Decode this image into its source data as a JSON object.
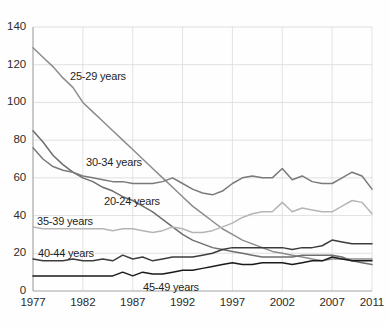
{
  "chart_data": {
    "type": "line",
    "title": "",
    "subtitle": "",
    "xlabel": "",
    "ylabel": "",
    "xlim": [
      1977,
      2011
    ],
    "ylim": [
      0,
      140
    ],
    "grid": true,
    "legend_position": "inline-labels",
    "y_ticks": [
      0,
      20,
      40,
      60,
      80,
      100,
      120,
      140
    ],
    "x_ticks": [
      1977,
      1982,
      1987,
      1992,
      1997,
      2002,
      2007,
      2011
    ],
    "y_tick_labels": [
      "0",
      "20",
      "40",
      "60",
      "80",
      "100",
      "120",
      "140"
    ],
    "x_tick_labels": [
      "1977",
      "1982",
      "1987",
      "1992",
      "1997",
      "2002",
      "2007",
      "2011"
    ],
    "x": [
      1977,
      1978,
      1979,
      1980,
      1981,
      1982,
      1983,
      1984,
      1985,
      1986,
      1987,
      1988,
      1989,
      1990,
      1991,
      1992,
      1993,
      1994,
      1995,
      1996,
      1997,
      1998,
      1999,
      2000,
      2001,
      2002,
      2003,
      2004,
      2005,
      2006,
      2007,
      2008,
      2009,
      2010,
      2011
    ],
    "series": [
      {
        "name": "25-29 years",
        "color": "#8c8c8c",
        "label": "25-29 years",
        "values": [
          129,
          124,
          119,
          113,
          108,
          100,
          95,
          90,
          85,
          80,
          75,
          70,
          65,
          60,
          55,
          50,
          45,
          41,
          37,
          33,
          30,
          27,
          25,
          23,
          21,
          20,
          19,
          18,
          17,
          16,
          17,
          17,
          17,
          17,
          17
        ]
      },
      {
        "name": "20-24 years",
        "color": "#6e6e6e",
        "label": "20-24 years",
        "values": [
          85,
          79,
          72,
          67,
          63,
          60,
          58,
          55,
          53,
          50,
          48,
          45,
          42,
          38,
          34,
          30,
          27,
          25,
          23,
          22,
          21,
          20,
          19,
          18,
          18,
          18,
          18,
          19,
          19,
          19,
          19,
          18,
          16,
          15,
          14
        ]
      },
      {
        "name": "30-34 years",
        "color": "#7a7a7a",
        "label": "30-34 years",
        "values": [
          76,
          70,
          66,
          64,
          63,
          61,
          60,
          59,
          58,
          58,
          57,
          57,
          57,
          58,
          60,
          57,
          54,
          52,
          51,
          53,
          57,
          60,
          61,
          60,
          60,
          65,
          59,
          61,
          58,
          57,
          57,
          60,
          63,
          61,
          54
        ]
      },
      {
        "name": "35-39 years",
        "color": "#b5b5b5",
        "label": "35-39 years",
        "values": [
          34,
          33,
          33,
          33,
          33,
          33,
          33,
          33,
          32,
          33,
          33,
          32,
          31,
          32,
          34,
          33,
          31,
          31,
          32,
          34,
          36,
          39,
          41,
          42,
          42,
          47,
          42,
          44,
          43,
          42,
          42,
          45,
          48,
          47,
          41
        ]
      },
      {
        "name": "40-44 years",
        "color": "#3c3c3c",
        "label": "40-44 years",
        "values": [
          17,
          16,
          16,
          16,
          17,
          16,
          16,
          17,
          16,
          19,
          17,
          18,
          16,
          17,
          18,
          18,
          18,
          19,
          20,
          22,
          23,
          23,
          23,
          23,
          23,
          23,
          22,
          23,
          23,
          24,
          27,
          26,
          25,
          25,
          25
        ]
      },
      {
        "name": "45-49 years",
        "color": "#1a1a1a",
        "label": "45-49 years",
        "values": [
          8,
          8,
          8,
          8,
          8,
          8,
          8,
          8,
          8,
          10,
          8,
          10,
          9,
          9,
          10,
          11,
          11,
          12,
          13,
          14,
          15,
          14,
          14,
          15,
          15,
          15,
          14,
          15,
          16,
          16,
          18,
          17,
          16,
          16,
          16
        ]
      }
    ],
    "series_label_positions": [
      {
        "name": "25-29 years",
        "x": 70,
        "y": 70
      },
      {
        "name": "30-34 years",
        "x": 86,
        "y": 156
      },
      {
        "name": "20-24 years",
        "x": 104,
        "y": 195
      },
      {
        "name": "35-39 years",
        "x": 37,
        "y": 215
      },
      {
        "name": "40-44 years",
        "x": 38,
        "y": 247
      },
      {
        "name": "45-49 years",
        "x": 143,
        "y": 281
      }
    ]
  },
  "plot_geometry": {
    "left": 33,
    "right": 372,
    "top": 27,
    "bottom": 291
  }
}
